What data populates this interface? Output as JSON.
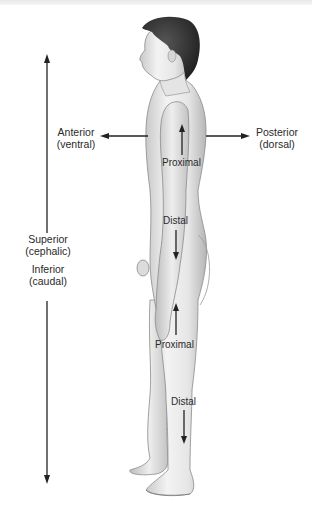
{
  "figure": {
    "labels": {
      "anterior": {
        "line1": "Anterior",
        "line2": "(ventral)"
      },
      "posterior": {
        "line1": "Posterior",
        "line2": "(dorsal)"
      },
      "superior": {
        "line1": "Superior",
        "line2": "(cephalic)"
      },
      "inferior": {
        "line1": "Inferior",
        "line2": "(caudal)"
      },
      "arm_proximal": "Proximal",
      "arm_distal": "Distal",
      "leg_proximal": "Proximal",
      "leg_distal": "Distal"
    },
    "arrows": [
      {
        "name": "superior-inferior-axis",
        "direction": "vertical-both"
      },
      {
        "name": "anterior-arrow",
        "direction": "left"
      },
      {
        "name": "posterior-arrow",
        "direction": "right"
      },
      {
        "name": "arm-proximal-arrow",
        "direction": "up"
      },
      {
        "name": "arm-distal-arrow",
        "direction": "down"
      },
      {
        "name": "leg-proximal-arrow",
        "direction": "up"
      },
      {
        "name": "leg-distal-arrow",
        "direction": "down"
      }
    ],
    "colors": {
      "text": "#2a2a2a",
      "arrow": "#222222",
      "skin_light": "#f1f1f1",
      "skin_shade": "#b9b9b9",
      "hair": "#2b2b2b"
    }
  }
}
